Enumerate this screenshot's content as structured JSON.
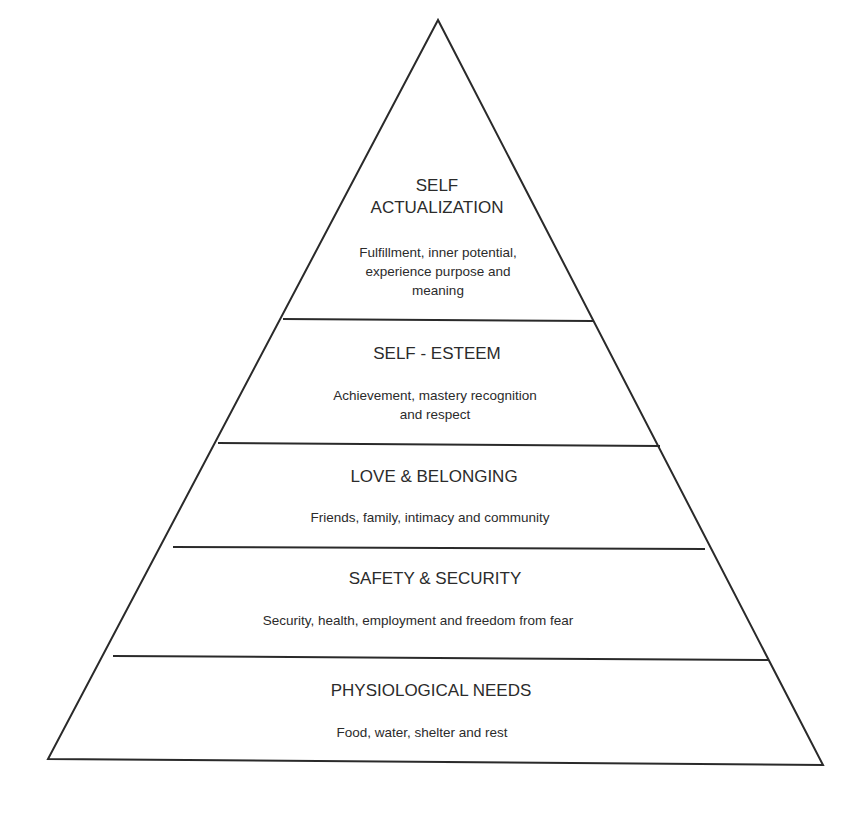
{
  "diagram": {
    "type": "pyramid",
    "apex": [
      438,
      20
    ],
    "colors": {
      "line": "#2a2a2a",
      "text": "#2b2b2b",
      "background": "#ffffff"
    },
    "levels": [
      {
        "title_lines": [
          "SELF",
          "ACTUALIZATION"
        ],
        "description_lines": [
          "Fulfillment, inner potential,",
          "experience purpose and",
          "meaning"
        ]
      },
      {
        "title_lines": [
          "SELF - ESTEEM"
        ],
        "description_lines": [
          "Achievement, mastery recognition",
          "and respect"
        ]
      },
      {
        "title_lines": [
          "LOVE & BELONGING"
        ],
        "description_lines": [
          "Friends, family, intimacy and community"
        ]
      },
      {
        "title_lines": [
          "SAFETY & SECURITY"
        ],
        "description_lines": [
          "Security, health, employment and freedom from fear"
        ]
      },
      {
        "title_lines": [
          "PHYSIOLOGICAL NEEDS"
        ],
        "description_lines": [
          "Food, water, shelter and rest"
        ]
      }
    ]
  }
}
